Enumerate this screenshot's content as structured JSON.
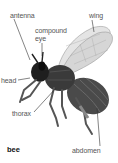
{
  "diagram": {
    "title": "bee",
    "labels": {
      "antenna": "antenna",
      "compound_eye_line1": "compound",
      "compound_eye_line2": "eye",
      "wing": "wing",
      "head": "head",
      "thorax": "thorax",
      "abdomen": "abdomen"
    },
    "colors": {
      "label_text": "#555555",
      "leader_line": "#333333",
      "body_dark": "#2a2a2a",
      "body_mid": "#5a5a5a",
      "wing": "#bdbdbd"
    }
  }
}
